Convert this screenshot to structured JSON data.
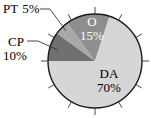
{
  "chart_data": {
    "type": "pie",
    "title": "",
    "start_angle_label": "9 o'clock, clockwise",
    "slices": [
      {
        "label": "CP",
        "value": 10,
        "pct_label": "10%",
        "color": "#707070",
        "label_color": "#000000",
        "label_placement": "outside-left"
      },
      {
        "label": "PT",
        "value": 5,
        "pct_label": "5%",
        "color": "#a8a8a8",
        "label_color": "#000000",
        "label_placement": "outside-top-left"
      },
      {
        "label": "O",
        "value": 15,
        "pct_label": "15%",
        "color": "#8e8e8e",
        "label_color": "#ffffff",
        "label_placement": "inside"
      },
      {
        "label": "DA",
        "value": 70,
        "pct_label": "70%",
        "color": "#d6d6d6",
        "label_color": "#000000",
        "label_placement": "inside"
      }
    ],
    "tick_marks": 12,
    "outline_color": "#1a1a1a"
  }
}
